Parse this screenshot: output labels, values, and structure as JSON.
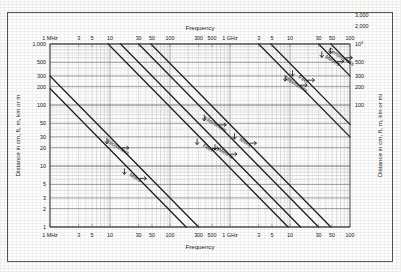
{
  "figure": {
    "top_axis_title": "Frequency",
    "bottom_axis_title": "Frequency",
    "left_axis_title": "Distance in cm, ft, m, km or m",
    "right_axis_title": "Distance in cm, ft, m, km or mi"
  },
  "chart_data": {
    "type": "line",
    "title": "Frequency",
    "xlabel": "Frequency",
    "ylabel": "Distance in cm, ft, m, km or m",
    "ylabel_right": "Distance in cm, ft, m, km or mi",
    "xscale": "log",
    "yscale": "log",
    "grid": true,
    "legend": "inline-rotated-labels",
    "xlim": [
      1,
      100000
    ],
    "xunit": "MHz",
    "x_tick_labels": [
      "1 MHz",
      "3",
      "5",
      "10",
      "30",
      "50",
      "100",
      "300",
      "500",
      "1 GHz",
      "3",
      "5",
      "10",
      "30",
      "50",
      "100"
    ],
    "x_tick_values": [
      1,
      3,
      5,
      10,
      30,
      50,
      100,
      300,
      500,
      1000,
      3000,
      5000,
      10000,
      30000,
      50000,
      100000
    ],
    "ylim_left": [
      1,
      1000
    ],
    "y_tick_labels_left": [
      "1,000",
      "500",
      "300",
      "200",
      "100",
      "50",
      "30",
      "20",
      "10",
      "5",
      "3",
      "2",
      "1"
    ],
    "y_tick_values_left": [
      1000,
      500,
      300,
      200,
      100,
      50,
      30,
      20,
      10,
      5,
      3,
      2,
      1
    ],
    "ylim_right": [
      100,
      100000
    ],
    "y_tick_labels_right": [
      "10⁵",
      "5 × 10⁴",
      "3 × 10⁴",
      "2 × 10⁴",
      "10⁴",
      "5,000",
      "3,000",
      "2,000",
      "10³",
      "500",
      "300",
      "200",
      "100"
    ],
    "y_tick_values_right": [
      100000,
      50000,
      30000,
      20000,
      10000,
      5000,
      3000,
      2000,
      1000,
      500,
      300,
      200,
      100
    ],
    "series": [
      {
        "name": "Kilometers",
        "label": "Kilometers",
        "x0": 1,
        "y0": 300,
        "decades": 2.477
      },
      {
        "name": "Miles",
        "label": "Miles",
        "x0": 1,
        "y0": 186,
        "decades": 2.27
      },
      {
        "name": "Kilometers 2",
        "label": "Kilometers",
        "x0": 30,
        "y0": 1000,
        "decades": 3.0
      },
      {
        "name": "Miles 2",
        "label": "Miles",
        "x0": 48,
        "y0": 1000,
        "decades": 3.0
      },
      {
        "name": "Millimeters",
        "label": "Millimeters",
        "x0": 300,
        "y0": 1000,
        "decades": 3.0
      },
      {
        "name": "Feet",
        "label": "Feet",
        "x0": 1,
        "y0": 1000,
        "decades": 3.0
      },
      {
        "name": "Meters",
        "label": "Meters",
        "x0": 1,
        "y0": 1000,
        "decades": 3.0
      },
      {
        "name": "Centimeters",
        "label": "Centimeters",
        "x0": 1,
        "y0": 1000,
        "decades": 3.0
      },
      {
        "name": "Feet 2",
        "label": "Feet",
        "x0": 1,
        "y0": 1000,
        "decades": 3.0
      },
      {
        "name": "Meters 2",
        "label": "Meters",
        "x0": 1,
        "y0": 1000,
        "decades": 3.0
      }
    ],
    "curve_labels": [
      "Kilometers",
      "Miles",
      "Feet",
      "Meters",
      "Kilometers",
      "Miles",
      "Millimeters",
      "Centimeters",
      "Feet",
      "Meters"
    ],
    "annotations": [
      "Diagonal lines are constant wavelength conversion scales on a log-log frequency vs distance nomogram"
    ]
  },
  "colors": {
    "background": "#fdfdfc",
    "frame": "#555555",
    "grid_minor": "#b9b9b9",
    "grid_major": "#6e6e6e",
    "curve": "#1b1b1b",
    "text": "#1a1a1a"
  }
}
